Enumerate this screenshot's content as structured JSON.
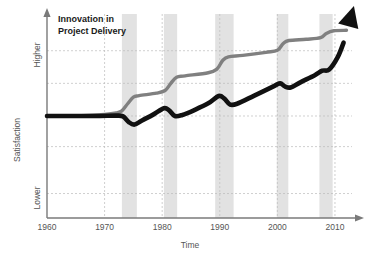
{
  "chart_data": {
    "type": "line",
    "title": "Innovation in Project Delivery",
    "title_line1": "Innovation in",
    "title_line2": "Project Delivery",
    "xlabel": "Time",
    "ylabel": "Satisfaction",
    "xlim": [
      1960,
      2014
    ],
    "ylim": [
      0,
      1
    ],
    "grid": true,
    "legend": "none",
    "x_ticks": [
      "1960",
      "1970",
      "1980",
      "1990",
      "2000",
      "2010"
    ],
    "x_tick_values": [
      1960,
      1970,
      1980,
      1990,
      2000,
      2010
    ],
    "y_tick_labels": [
      "Lower",
      "Higher"
    ],
    "y_tick_low_value": 0.18,
    "y_tick_high_value": 0.86,
    "y_gridline_values": [
      0.12,
      0.35,
      0.5,
      0.66,
      0.82
    ],
    "colors": {
      "technology_line": "#808080",
      "delivery_line": "#111111",
      "band_fill": "#e2e2e2",
      "grid": "#bbbbbb",
      "axis": "#7a7a7a",
      "title": "#1a1a1a",
      "label": "#555555"
    },
    "shaded_bands": [
      {
        "label": "recession-1974",
        "start": 1973.0,
        "end": 1975.6
      },
      {
        "label": "recession-1981",
        "start": 1980.3,
        "end": 1982.6
      },
      {
        "label": "recession-1990",
        "start": 1989.2,
        "end": 1992.4
      },
      {
        "label": "recession-2001",
        "start": 1999.9,
        "end": 2001.9
      },
      {
        "label": "recession-2008",
        "start": 2007.3,
        "end": 2009.6
      }
    ],
    "series": [
      {
        "name": "Technology Potential",
        "color": "#808080",
        "style": "stepped-rising",
        "points": [
          {
            "x": 1960,
            "y": 0.5
          },
          {
            "x": 1966,
            "y": 0.502
          },
          {
            "x": 1970,
            "y": 0.508
          },
          {
            "x": 1972,
            "y": 0.515
          },
          {
            "x": 1973,
            "y": 0.525
          },
          {
            "x": 1974,
            "y": 0.56
          },
          {
            "x": 1975,
            "y": 0.592
          },
          {
            "x": 1976,
            "y": 0.6
          },
          {
            "x": 1979,
            "y": 0.612
          },
          {
            "x": 1980.5,
            "y": 0.625
          },
          {
            "x": 1981.5,
            "y": 0.66
          },
          {
            "x": 1982.5,
            "y": 0.69
          },
          {
            "x": 1984,
            "y": 0.697
          },
          {
            "x": 1988,
            "y": 0.712
          },
          {
            "x": 1989.5,
            "y": 0.73
          },
          {
            "x": 1990.5,
            "y": 0.772
          },
          {
            "x": 1991.5,
            "y": 0.79
          },
          {
            "x": 1994,
            "y": 0.797
          },
          {
            "x": 1998,
            "y": 0.812
          },
          {
            "x": 2000,
            "y": 0.822
          },
          {
            "x": 2001,
            "y": 0.855
          },
          {
            "x": 2002,
            "y": 0.87
          },
          {
            "x": 2005,
            "y": 0.876
          },
          {
            "x": 2007.5,
            "y": 0.884
          },
          {
            "x": 2008.5,
            "y": 0.905
          },
          {
            "x": 2009.8,
            "y": 0.918
          },
          {
            "x": 2012,
            "y": 0.92
          }
        ]
      },
      {
        "name": "Project Delivery Satisfaction",
        "color": "#111111",
        "style": "sawtooth-rising-with-arrow",
        "has_arrow_head": true,
        "points": [
          {
            "x": 1960,
            "y": 0.5
          },
          {
            "x": 1968,
            "y": 0.5
          },
          {
            "x": 1972,
            "y": 0.502
          },
          {
            "x": 1973.2,
            "y": 0.498
          },
          {
            "x": 1974.2,
            "y": 0.47
          },
          {
            "x": 1975.2,
            "y": 0.458
          },
          {
            "x": 1976.5,
            "y": 0.478
          },
          {
            "x": 1978.5,
            "y": 0.508
          },
          {
            "x": 1980.3,
            "y": 0.538
          },
          {
            "x": 1981.2,
            "y": 0.528
          },
          {
            "x": 1982.2,
            "y": 0.5
          },
          {
            "x": 1983.5,
            "y": 0.505
          },
          {
            "x": 1985.5,
            "y": 0.528
          },
          {
            "x": 1988,
            "y": 0.562
          },
          {
            "x": 1989.8,
            "y": 0.598
          },
          {
            "x": 1990.8,
            "y": 0.585
          },
          {
            "x": 1991.8,
            "y": 0.556
          },
          {
            "x": 1993,
            "y": 0.56
          },
          {
            "x": 1996,
            "y": 0.6
          },
          {
            "x": 1999.5,
            "y": 0.648
          },
          {
            "x": 2000.5,
            "y": 0.66
          },
          {
            "x": 2001.3,
            "y": 0.645
          },
          {
            "x": 2002.3,
            "y": 0.64
          },
          {
            "x": 2004,
            "y": 0.665
          },
          {
            "x": 2006.5,
            "y": 0.7
          },
          {
            "x": 2007.8,
            "y": 0.722
          },
          {
            "x": 2009,
            "y": 0.728
          },
          {
            "x": 2010.5,
            "y": 0.79
          },
          {
            "x": 2011.5,
            "y": 0.86
          },
          {
            "x": 2012.3,
            "y": 0.94
          }
        ]
      }
    ]
  }
}
